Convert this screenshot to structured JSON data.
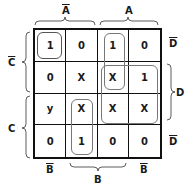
{
  "top_labels": {
    "a_bar": "A",
    "a": "A"
  },
  "bottom_labels": {
    "b_bar_left": "B",
    "b": "B",
    "b_bar_right": "B"
  },
  "left_labels": {
    "c_bar": "C",
    "c": "C"
  },
  "right_labels": {
    "d_bar_top": "D",
    "d": "D",
    "d_bar_bottom": "D"
  },
  "rows": [
    {
      "label": "C̄D̄",
      "cells": [
        "1",
        "0",
        "1",
        "0"
      ]
    },
    {
      "label": "C̄D",
      "cells": [
        "0",
        "X",
        "X",
        "1"
      ]
    },
    {
      "label": "CD",
      "cells": [
        "y",
        "X",
        "X",
        "X"
      ]
    },
    {
      "label": "CD̄",
      "cells": [
        "0",
        "1",
        "0",
        "0"
      ]
    }
  ],
  "loops": [
    {
      "name": "loop-single-top-left",
      "cells": "row0-col0"
    },
    {
      "name": "loop-pair-col2-rows0-1",
      "cells": "col2 rows0-1"
    },
    {
      "name": "loop-quad-cols2-3-rows1-2",
      "cells": "cols2-3 rows1-2"
    },
    {
      "name": "loop-pair-col1-rows2-3",
      "cells": "col1 rows2-3"
    }
  ]
}
